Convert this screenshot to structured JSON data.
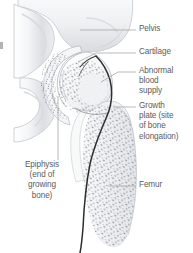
{
  "figure": {
    "background_color": "#ffffff",
    "text_color": "#5c5c5c",
    "leader_line_color": "#9b9b9b",
    "bone_outline_color": "#b9bcc2",
    "bone_fill_color": "#f2f3f5",
    "stipple_color": "#6d7076",
    "vessel_color": "#2e2e2e"
  },
  "labels": {
    "pelvis": "Pelvis",
    "cartilage": "Cartilage",
    "abnormal_blood_supply": "Abnormal\nblood\nsupply",
    "growth_plate": "Growth\nplate (site\nof bone\nelongation)",
    "femur": "Femur",
    "epiphysis": "Epiphysis\n(end of\ngrowing\nbone)"
  },
  "annotations": [
    {
      "name": "pelvis",
      "text": "Pelvis",
      "side": "right",
      "leader": "horizontal"
    },
    {
      "name": "cartilage",
      "text": "Cartilage",
      "side": "right",
      "leader": "angled"
    },
    {
      "name": "abnormal-blood-supply",
      "text": "Abnormal blood supply",
      "side": "right",
      "leader": "angled"
    },
    {
      "name": "growth-plate",
      "text": "Growth plate (site of bone elongation)",
      "side": "right",
      "leader": "horizontal"
    },
    {
      "name": "femur",
      "text": "Femur",
      "side": "right",
      "leader": "horizontal"
    },
    {
      "name": "epiphysis",
      "text": "Epiphysis (end of growing bone)",
      "side": "left",
      "leader": "vertical"
    }
  ],
  "structures": [
    {
      "name": "pelvis-bone",
      "description": "Pelvic bone with acetabulum socket at top of figure"
    },
    {
      "name": "acetabulum-cartilage",
      "description": "Curved stippled cartilage band lining the hip socket"
    },
    {
      "name": "femoral-head",
      "description": "Rounded head of femur seated in the socket"
    },
    {
      "name": "growth-plate-line",
      "description": "Boundary between femoral head epiphysis and femur neck"
    },
    {
      "name": "femur-shaft",
      "description": "Stippled trabecular bone of the upper femur shaft"
    },
    {
      "name": "blood-vessel",
      "description": "Dark curved line tracing abnormal blood supply along femoral neck and shaft"
    },
    {
      "name": "ischium",
      "description": "Lower ring of pelvic bone at left of figure"
    }
  ]
}
